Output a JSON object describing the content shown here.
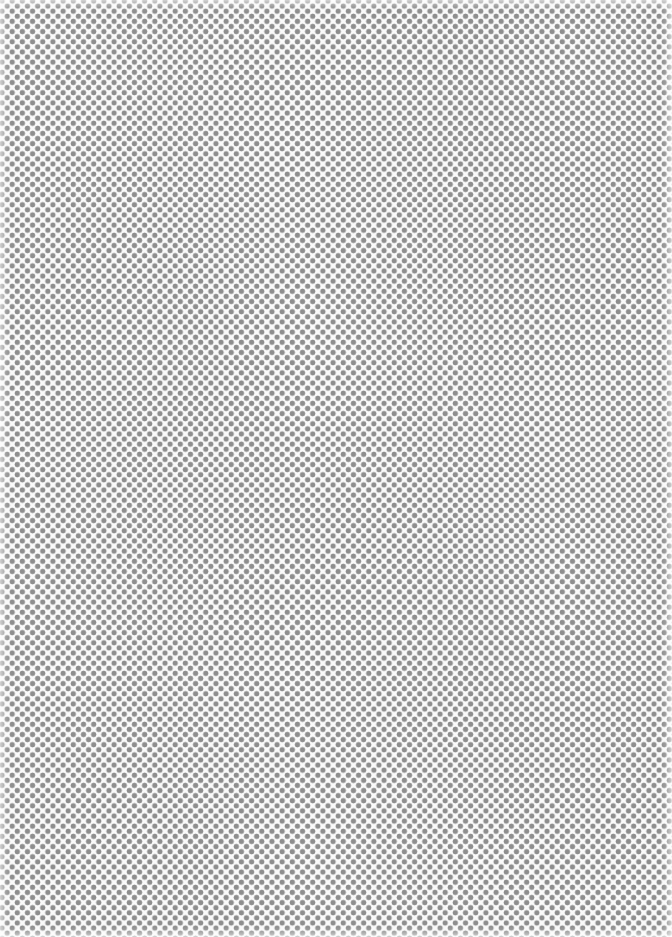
{
  "image": {
    "description": "Staggered gray polka-dot pattern on white background",
    "dot_color": "#8e8e8e",
    "background_color": "#fafafa",
    "dot_spacing_px": 10,
    "dot_diameter_px": 5,
    "layout": "hexagonal offset grid"
  }
}
